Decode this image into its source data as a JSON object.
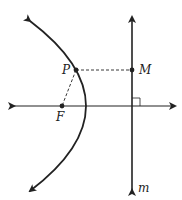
{
  "diagram": {
    "type": "parabola-focus-directrix",
    "labels": {
      "point_on_curve": "P",
      "foot_on_directrix": "M",
      "focus": "F",
      "directrix": "m"
    },
    "colors": {
      "stroke": "#222222",
      "background": "#ffffff"
    }
  }
}
